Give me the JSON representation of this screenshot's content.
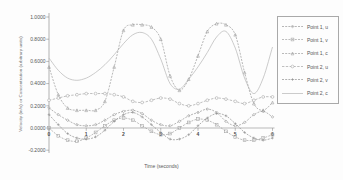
{
  "colors": {
    "background": "#fdfdfd",
    "axis": "#8f8f8f",
    "tick_text": "#555555",
    "legend_border": "#a9a9a9"
  },
  "chart_data": {
    "type": "line",
    "xlabel": "Time (seconds)",
    "ylabel": "Velocity (in/s) or Concentration (arbitrary units)",
    "xlim": [
      0,
      6
    ],
    "ylim": [
      -0.2,
      1.0
    ],
    "grid": false,
    "legend_position": "right",
    "x_ticks": [
      0,
      1,
      2,
      3,
      4,
      5,
      6
    ],
    "y_ticks": [
      {
        "value": 1.0,
        "label": "1.0000"
      },
      {
        "value": 0.8,
        "label": "0.8000"
      },
      {
        "value": 0.6,
        "label": "0.6000"
      },
      {
        "value": 0.4,
        "label": "0.4000"
      },
      {
        "value": 0.2,
        "label": "0.2000"
      },
      {
        "value": 0.0,
        "label": "0.0000"
      },
      {
        "value": -0.2,
        "label": "-0.2000"
      }
    ],
    "x": [
      0,
      0.25,
      0.5,
      0.75,
      1,
      1.25,
      1.5,
      1.75,
      2,
      2.25,
      2.5,
      2.75,
      3,
      3.25,
      3.5,
      3.75,
      4,
      4.25,
      4.5,
      4.75,
      5,
      5.25,
      5.5,
      5.75,
      6
    ],
    "series": [
      {
        "name": "Point 1, u",
        "marker": "diamond",
        "color": "#969696",
        "dash": "2 1.2",
        "values": [
          0.18,
          0.12,
          0.07,
          0.03,
          0.02,
          0.03,
          0.07,
          0.12,
          0.15,
          0.16,
          0.13,
          0.07,
          0.03,
          0.02,
          0.06,
          0.11,
          0.14,
          0.17,
          0.14,
          0.06,
          0.02,
          0.05,
          0.12,
          0.15,
          0.1
        ]
      },
      {
        "name": "Point 1, v",
        "marker": "square",
        "color": "#a0a0a0",
        "dash": "2 1.2",
        "values": [
          0.0,
          -0.07,
          -0.11,
          -0.12,
          -0.09,
          -0.04,
          0.02,
          0.07,
          0.09,
          0.07,
          0.02,
          -0.03,
          -0.06,
          -0.05,
          0.0,
          0.05,
          0.08,
          0.07,
          0.03,
          -0.03,
          -0.08,
          -0.11,
          -0.11,
          -0.09,
          -0.06
        ]
      },
      {
        "name": "Point 1, c",
        "marker": "triangle",
        "color": "#9b9b9b",
        "dash": "2 1.2",
        "values": [
          0.55,
          0.3,
          0.18,
          0.16,
          0.16,
          0.16,
          0.24,
          0.55,
          0.88,
          0.93,
          0.93,
          0.91,
          0.8,
          0.47,
          0.34,
          0.44,
          0.65,
          0.87,
          0.94,
          0.93,
          0.84,
          0.5,
          0.22,
          0.16,
          0.23
        ]
      },
      {
        "name": "Point 2, u",
        "marker": "circle",
        "color": "#a3a3a3",
        "dash": "2.4 1.4",
        "values": [
          0.25,
          0.27,
          0.29,
          0.3,
          0.31,
          0.31,
          0.31,
          0.3,
          0.28,
          0.24,
          0.23,
          0.25,
          0.27,
          0.26,
          0.22,
          0.2,
          0.22,
          0.25,
          0.27,
          0.26,
          0.24,
          0.22,
          0.25,
          0.28,
          0.28
        ]
      },
      {
        "name": "Point 2, v",
        "marker": "plus",
        "color": "#8f8f8f",
        "dash": "2 1.2",
        "values": [
          0.12,
          0.03,
          -0.05,
          -0.09,
          -0.1,
          -0.08,
          -0.02,
          0.06,
          0.12,
          0.14,
          0.1,
          0.03,
          -0.04,
          -0.1,
          -0.1,
          -0.06,
          0.02,
          0.09,
          0.13,
          0.11,
          0.04,
          -0.04,
          -0.09,
          -0.11,
          -0.09
        ]
      },
      {
        "name": "Point 2, c",
        "marker": "none",
        "color": "#b5b5b5",
        "dash": "",
        "values": [
          0.63,
          0.52,
          0.45,
          0.43,
          0.45,
          0.5,
          0.57,
          0.66,
          0.76,
          0.84,
          0.86,
          0.8,
          0.62,
          0.4,
          0.35,
          0.44,
          0.55,
          0.68,
          0.82,
          0.87,
          0.72,
          0.45,
          0.31,
          0.45,
          0.73
        ]
      }
    ]
  }
}
